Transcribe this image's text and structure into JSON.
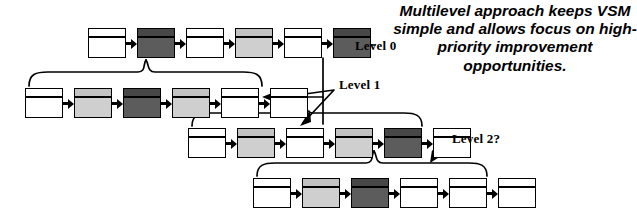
{
  "diagram": {
    "title_callout": "Multilevel approach keeps VSM simple and allows focus on high-priority improvement opportunities.",
    "labels": {
      "level0": "Level  0",
      "level1": "Level 1",
      "level2": "Level 2?"
    },
    "rows": [
      {
        "id": "level-0-row",
        "name": "value-stream-row-level-0",
        "left": 88,
        "top": 28,
        "boxes": [
          {
            "fill": "white",
            "name": "process-box-0-1"
          },
          {
            "fill": "dark",
            "name": "process-box-0-2"
          },
          {
            "fill": "white",
            "name": "process-box-0-3"
          },
          {
            "fill": "light",
            "name": "process-box-0-4"
          },
          {
            "fill": "white",
            "name": "process-box-0-5"
          },
          {
            "fill": "dark",
            "name": "process-box-0-6"
          }
        ]
      },
      {
        "id": "level-1-row",
        "name": "value-stream-row-level-1",
        "left": 25,
        "top": 88,
        "boxes": [
          {
            "fill": "white",
            "name": "process-box-1-1"
          },
          {
            "fill": "light",
            "name": "process-box-1-2"
          },
          {
            "fill": "dark",
            "name": "process-box-1-3"
          },
          {
            "fill": "light",
            "name": "process-box-1-4"
          },
          {
            "fill": "white",
            "name": "process-box-1-5"
          },
          {
            "fill": "white",
            "name": "process-box-1-6"
          }
        ]
      },
      {
        "id": "level-2-row",
        "name": "value-stream-row-level-2",
        "left": 188,
        "top": 128,
        "boxes": [
          {
            "fill": "white",
            "name": "process-box-2-1"
          },
          {
            "fill": "light",
            "name": "process-box-2-2"
          },
          {
            "fill": "white",
            "name": "process-box-2-3"
          },
          {
            "fill": "light",
            "name": "process-box-2-4"
          },
          {
            "fill": "dark",
            "name": "process-box-2-5"
          },
          {
            "fill": "white",
            "name": "process-box-2-6"
          }
        ]
      },
      {
        "id": "level-3-row",
        "name": "value-stream-row-level-3",
        "left": 253,
        "top": 178,
        "boxes": [
          {
            "fill": "white",
            "name": "process-box-3-1"
          },
          {
            "fill": "light",
            "name": "process-box-3-2"
          },
          {
            "fill": "dark",
            "name": "process-box-3-3"
          },
          {
            "fill": "white",
            "name": "process-box-3-4"
          },
          {
            "fill": "white",
            "name": "process-box-3-5"
          },
          {
            "fill": "white",
            "name": "process-box-3-6"
          }
        ]
      }
    ],
    "colors": {
      "white_fill": "#ffffff",
      "light_fill": "#cfcfcf",
      "dark_fill": "#5c5c5c",
      "stroke": "#000000",
      "background": "#ffffff"
    }
  }
}
